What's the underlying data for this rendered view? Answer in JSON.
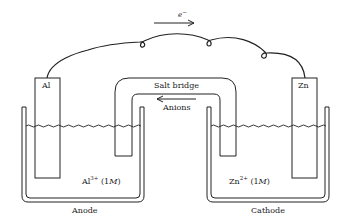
{
  "diagram": {
    "electron_label": "e",
    "electron_sup": "−",
    "electrode_left": "Al",
    "electrode_right": "Zn",
    "salt_bridge": "Salt bridge",
    "anions": "Anions",
    "solution_left": {
      "ion": "Al",
      "charge": "3+",
      "conc_open": "(1",
      "conc_unit": "M",
      "conc_close": ")"
    },
    "solution_right": {
      "ion": "Zn",
      "charge": "2+",
      "conc_open": "(1",
      "conc_unit": "M",
      "conc_close": ")"
    },
    "beaker_left": "Anode",
    "beaker_right": "Cathode",
    "colors": {
      "stroke": "#222222",
      "background": "#ffffff"
    }
  }
}
